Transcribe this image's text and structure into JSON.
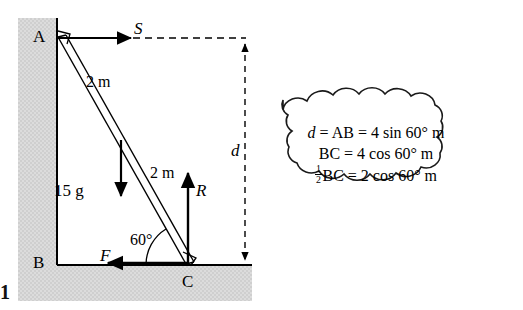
{
  "figure": {
    "kind": "statics-ladder-diagram",
    "points": {
      "a": "A",
      "b": "B",
      "c": "C"
    },
    "forces": {
      "s": "S",
      "r": "R",
      "f": "F",
      "weight": "15 g"
    },
    "lengths": {
      "upper": "2 m",
      "lower": "2 m"
    },
    "angle": "60°",
    "dimension": "d",
    "page_marker": "1"
  },
  "callout": {
    "line1": {
      "var": "d",
      "eq1": " = AB = 4 sin 60° m"
    },
    "line2": "BC = 4 cos 60° m",
    "line3": {
      "fraction_num": "1",
      "fraction_den": "2",
      "rest": "BC = 2 cos 60° m"
    }
  },
  "colors": {
    "wall_fill": "#d9d9d9",
    "ground_fill": "#d9d9d9",
    "stroke": "#000000",
    "background": "#ffffff"
  }
}
